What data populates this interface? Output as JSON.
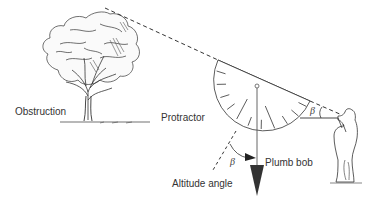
{
  "diagram": {
    "type": "instrument-measurement-illustration",
    "labels": {
      "obstruction": "Obstruction",
      "protractor": "Protractor",
      "plumb_bob": "Plumb bob",
      "altitude_angle": "Altitude angle",
      "beta_observer": "β",
      "beta_plumb": "β"
    },
    "elements": [
      {
        "id": "tree",
        "role": "obstruction"
      },
      {
        "id": "sight-line",
        "style": "dashed",
        "from": "observer-eye",
        "to": "tree-top"
      },
      {
        "id": "protractor",
        "shape": "semicircle",
        "tick_count": 11
      },
      {
        "id": "plumb-line",
        "style": "solid"
      },
      {
        "id": "plumb-bob",
        "shape": "triangle"
      },
      {
        "id": "altitude-line",
        "style": "dashed"
      },
      {
        "id": "observer",
        "role": "person sighting"
      }
    ],
    "colors": {
      "ink": "#333333",
      "background": "#ffffff"
    }
  }
}
